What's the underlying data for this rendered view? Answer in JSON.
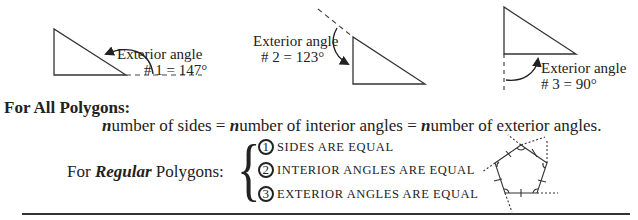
{
  "diagrams": [
    {
      "label_line1": "Exterior angle",
      "label_line2": "# 1 = 147°"
    },
    {
      "label_line1": "Exterior angle",
      "label_line2": "# 2 = 123°"
    },
    {
      "label_line1": "Exterior angle",
      "label_line2": "# 3 = 90°"
    }
  ],
  "all_polygons": {
    "heading": "For All Polygons:",
    "n": "n",
    "part1": "umber of sides = ",
    "part2": "umber of interior angles = ",
    "part3": "umber of exterior angles."
  },
  "regular_polygons": {
    "prefix": "For ",
    "emph": "Regular",
    "suffix": " Polygons:",
    "brace": "{",
    "items": [
      {
        "num": "1",
        "text": "SIDES ARE EQUAL"
      },
      {
        "num": "2",
        "text": "INTERIOR ANGLES ARE EQUAL"
      },
      {
        "num": "3",
        "text": "EXTERIOR ANGLES ARE EQUAL"
      }
    ]
  }
}
